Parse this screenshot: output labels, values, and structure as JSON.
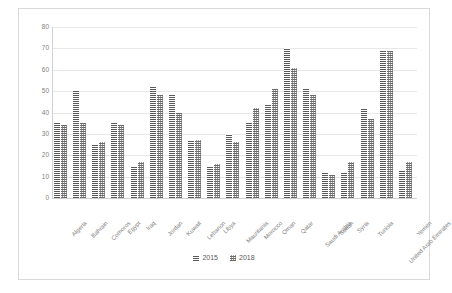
{
  "chart_data": {
    "type": "bar",
    "title": "",
    "subtitle": "",
    "xlabel": "",
    "ylabel": "",
    "ylim": [
      0,
      80
    ],
    "ytick_step": 10,
    "yticks": [
      "0",
      "10",
      "20",
      "30",
      "40",
      "50",
      "60",
      "70",
      "80"
    ],
    "grid": true,
    "legend_position": "bottom",
    "categories": [
      "Algeria",
      "Bahrain",
      "Comoros",
      "Egypt",
      "Iraq",
      "Jordan",
      "Kuwait",
      "Lebanon",
      "Libya",
      "Mauritania",
      "Morocco",
      "Oman",
      "Qatar",
      "Saudi Arabia",
      "Sudan",
      "Syria",
      "Tunisia",
      "United Arab Emirates",
      "Yemen"
    ],
    "series": [
      {
        "name": "2015",
        "color": "#808080",
        "values": [
          35,
          50,
          25,
          35,
          15,
          52,
          48,
          27,
          15,
          30,
          35,
          44,
          70,
          51,
          12,
          12,
          42,
          69,
          13
        ]
      },
      {
        "name": "2018",
        "color": "#9a9a9a",
        "values": [
          34,
          35,
          26,
          34,
          17,
          48,
          40,
          27,
          16,
          26,
          42,
          51,
          61,
          48,
          11,
          17,
          37,
          69,
          17
        ]
      }
    ]
  },
  "legend": {
    "items": [
      {
        "label": "2015"
      },
      {
        "label": "2018"
      }
    ]
  }
}
